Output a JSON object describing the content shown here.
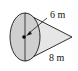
{
  "diagram": {
    "type": "cone",
    "orientation": "lying on side, base on left, apex on right",
    "labels": {
      "radius": "6 m",
      "slant_height": "8 m"
    },
    "colors": {
      "base_fill": "#cfcfcf",
      "body_fill": "#e6e6e6",
      "stroke": "#1a1a1a"
    }
  }
}
